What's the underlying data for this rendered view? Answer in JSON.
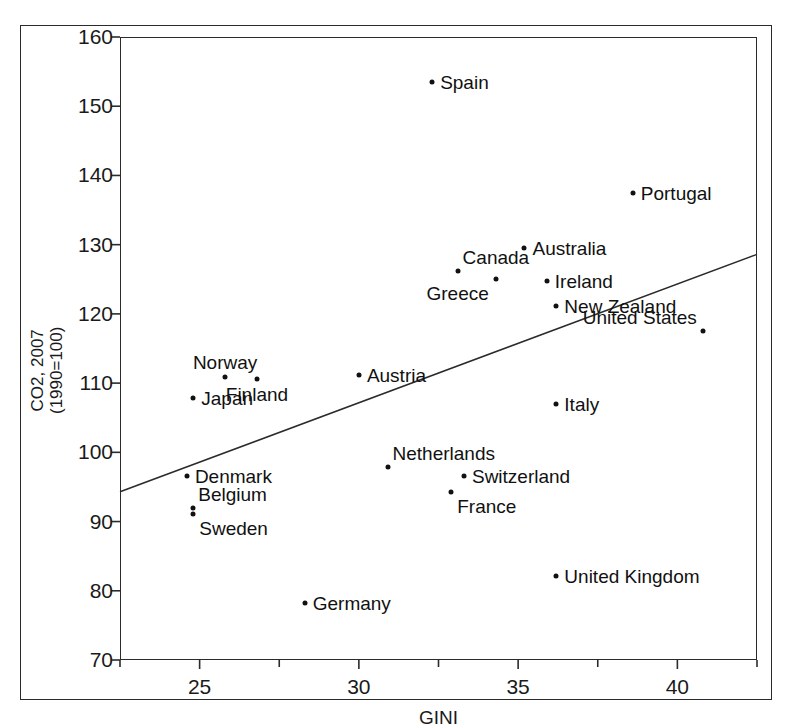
{
  "chart_data": {
    "type": "scatter",
    "title": "",
    "xlabel": "GINI",
    "ylabel_line1": "CO2, 2007",
    "ylabel_line2": "(1990=100)",
    "xlim": [
      22.5,
      42.5
    ],
    "ylim": [
      70,
      160
    ],
    "xticks": [
      25,
      30,
      35,
      40
    ],
    "yticks": [
      70,
      80,
      90,
      100,
      110,
      120,
      130,
      140,
      150,
      160
    ],
    "xtick_labels": [
      "25",
      "30",
      "35",
      "40"
    ],
    "ytick_labels": [
      "70",
      "80",
      "90",
      "100",
      "110",
      "120",
      "130",
      "140",
      "150",
      "160"
    ],
    "grid": false,
    "legend": "none",
    "points": [
      {
        "label": "Spain",
        "x": 32.3,
        "y": 153.5,
        "label_side": "right"
      },
      {
        "label": "Portugal",
        "x": 38.6,
        "y": 137.5,
        "label_side": "right"
      },
      {
        "label": "Australia",
        "x": 35.2,
        "y": 129.5,
        "label_side": "right"
      },
      {
        "label": "Canada",
        "x": 33.1,
        "y": 126.2,
        "label_side": "right-up"
      },
      {
        "label": "Ireland",
        "x": 35.9,
        "y": 124.8,
        "label_side": "right"
      },
      {
        "label": "Greece",
        "x": 34.3,
        "y": 125.0,
        "label_side": "left-down"
      },
      {
        "label": "New Zealand",
        "x": 36.2,
        "y": 121.2,
        "label_side": "right"
      },
      {
        "label": "United States",
        "x": 40.8,
        "y": 117.5,
        "label_side": "left-up"
      },
      {
        "label": "Norway",
        "x": 25.8,
        "y": 110.9,
        "label_side": "up"
      },
      {
        "label": "Finland",
        "x": 26.8,
        "y": 110.6,
        "label_side": "down"
      },
      {
        "label": "Japan",
        "x": 24.8,
        "y": 107.8,
        "label_side": "right"
      },
      {
        "label": "Austria",
        "x": 30.0,
        "y": 111.1,
        "label_side": "right"
      },
      {
        "label": "Italy",
        "x": 36.2,
        "y": 107.0,
        "label_side": "right"
      },
      {
        "label": "Netherlands",
        "x": 30.9,
        "y": 97.9,
        "label_side": "right-up"
      },
      {
        "label": "Switzerland",
        "x": 33.3,
        "y": 96.6,
        "label_side": "right"
      },
      {
        "label": "France",
        "x": 32.9,
        "y": 94.3,
        "label_side": "right-down"
      },
      {
        "label": "Denmark",
        "x": 24.6,
        "y": 96.6,
        "label_side": "right"
      },
      {
        "label": "Belgium",
        "x": 24.8,
        "y": 92.0,
        "label_side": "right-up"
      },
      {
        "label": "Sweden",
        "x": 24.8,
        "y": 91.1,
        "label_side": "right-down"
      },
      {
        "label": "United Kingdom",
        "x": 36.2,
        "y": 82.2,
        "label_side": "right"
      },
      {
        "label": "Germany",
        "x": 28.3,
        "y": 78.3,
        "label_side": "right"
      }
    ],
    "trendline": {
      "x_start": 22.5,
      "y_start": 94.3,
      "x_end": 42.5,
      "y_end": 128.6
    }
  },
  "colors": {
    "marker": "#111111",
    "line": "#2b2b2b",
    "axis": "#2b2b2b",
    "background": "#ffffff"
  }
}
